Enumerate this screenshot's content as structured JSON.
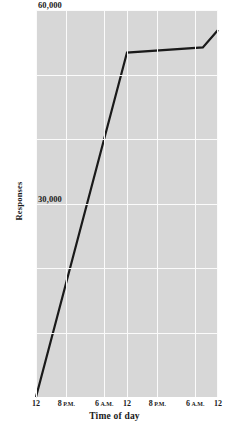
{
  "chart_data": {
    "type": "line",
    "title": "",
    "xlabel": "Time of day",
    "ylabel": "Responses",
    "ylim": [
      0,
      60000
    ],
    "xlim": [
      0,
      48
    ],
    "grid": true,
    "legend": null,
    "y_ticks": [
      {
        "value": 60000,
        "label": "60,000"
      },
      {
        "value": 30000,
        "label": "30,000"
      }
    ],
    "y_gridlines": [
      60000,
      50000,
      40000,
      30000,
      20000,
      10000
    ],
    "x_ticks": [
      {
        "value": 0,
        "label": "12",
        "sub": ""
      },
      {
        "value": 8,
        "label": "8",
        "sub": "P.M."
      },
      {
        "value": 18,
        "label": "6",
        "sub": "A.M."
      },
      {
        "value": 24,
        "label": "12",
        "sub": ""
      },
      {
        "value": 32,
        "label": "8",
        "sub": "P.M."
      },
      {
        "value": 42,
        "label": "6",
        "sub": "A.M."
      },
      {
        "value": 48,
        "label": "12",
        "sub": ""
      }
    ],
    "series": [
      {
        "name": "Responses",
        "color": "#1a1a1a",
        "points": [
          {
            "x": 0,
            "y": 0
          },
          {
            "x": 24,
            "y": 53400
          },
          {
            "x": 44,
            "y": 54200
          },
          {
            "x": 48,
            "y": 56900
          }
        ]
      }
    ],
    "colors": {
      "panel_background": "#d7d7d7",
      "gridline": "#fbfbfb",
      "line": "#1a1a1a",
      "text": "#1a1a1a",
      "page_background": "#ffffff"
    }
  }
}
